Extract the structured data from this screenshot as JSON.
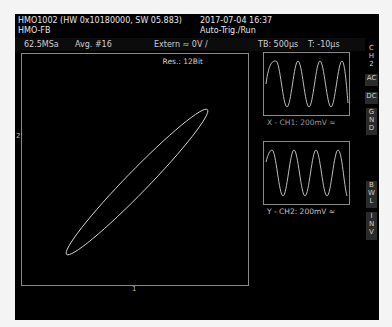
{
  "header": {
    "device_line": "HMO1002 (HW 0x10180000, SW 05.883)",
    "mode_line": "HMO-FB",
    "datetime": "2017-07-04 16:37",
    "trigger_state": "Auto-Trig./Run"
  },
  "status": {
    "sample_rate": "62.5MSa",
    "averaging": "Avg. #16",
    "trigger_source": "Extern ≈ 0V /",
    "timebase": "TB: 500µs",
    "trigger_time": "T: -10µs"
  },
  "xy_display": {
    "resolution": "Res.: 12Bit",
    "y_marker": "2",
    "x_marker": "1",
    "trace_color": "#e0e0e0"
  },
  "mini_x": {
    "label": "X - CH1: 200mV ≈",
    "cycles": 6
  },
  "mini_y": {
    "label": "Y - CH2: 200mV ≈",
    "cycles": 6
  },
  "side_menu": [
    {
      "label": "C H 2",
      "active": false
    },
    {
      "label": "AC",
      "active": true
    },
    {
      "label": "DC",
      "active": true
    },
    {
      "label": "G N D",
      "active": true
    },
    {
      "label": "B W L",
      "active": true
    },
    {
      "label": "I N V",
      "active": true
    }
  ]
}
